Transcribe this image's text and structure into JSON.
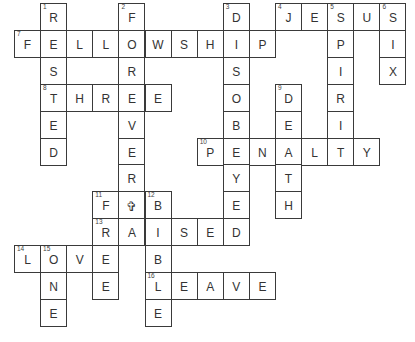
{
  "puzzle": {
    "type": "crossword",
    "cell_width": 26.1,
    "cell_height": 26.9,
    "origin_x": 14,
    "origin_y": 3,
    "cells": [
      {
        "r": 0,
        "c": 1,
        "letter": "R",
        "num": "1"
      },
      {
        "r": 0,
        "c": 4,
        "letter": "F",
        "num": "2"
      },
      {
        "r": 0,
        "c": 8,
        "letter": "D",
        "num": "3"
      },
      {
        "r": 0,
        "c": 10,
        "letter": "J",
        "num": "4"
      },
      {
        "r": 0,
        "c": 11,
        "letter": "E"
      },
      {
        "r": 0,
        "c": 12,
        "letter": "S",
        "num": "5"
      },
      {
        "r": 0,
        "c": 13,
        "letter": "U"
      },
      {
        "r": 0,
        "c": 14,
        "letter": "S",
        "num": "6"
      },
      {
        "r": 1,
        "c": 0,
        "letter": "F",
        "num": "7"
      },
      {
        "r": 1,
        "c": 1,
        "letter": "E"
      },
      {
        "r": 1,
        "c": 2,
        "letter": "L"
      },
      {
        "r": 1,
        "c": 3,
        "letter": "L"
      },
      {
        "r": 1,
        "c": 4,
        "letter": "O"
      },
      {
        "r": 1,
        "c": 5,
        "letter": "W"
      },
      {
        "r": 1,
        "c": 6,
        "letter": "S"
      },
      {
        "r": 1,
        "c": 7,
        "letter": "H"
      },
      {
        "r": 1,
        "c": 8,
        "letter": "I"
      },
      {
        "r": 1,
        "c": 9,
        "letter": "P"
      },
      {
        "r": 1,
        "c": 12,
        "letter": "P"
      },
      {
        "r": 1,
        "c": 14,
        "letter": "I"
      },
      {
        "r": 2,
        "c": 1,
        "letter": "S"
      },
      {
        "r": 2,
        "c": 4,
        "letter": "R"
      },
      {
        "r": 2,
        "c": 8,
        "letter": "S"
      },
      {
        "r": 2,
        "c": 12,
        "letter": "I"
      },
      {
        "r": 2,
        "c": 14,
        "letter": "X"
      },
      {
        "r": 3,
        "c": 1,
        "letter": "T",
        "num": "8"
      },
      {
        "r": 3,
        "c": 2,
        "letter": "H"
      },
      {
        "r": 3,
        "c": 3,
        "letter": "R"
      },
      {
        "r": 3,
        "c": 4,
        "letter": "E"
      },
      {
        "r": 3,
        "c": 5,
        "letter": "E"
      },
      {
        "r": 3,
        "c": 8,
        "letter": "O"
      },
      {
        "r": 3,
        "c": 10,
        "letter": "D",
        "num": "9"
      },
      {
        "r": 3,
        "c": 12,
        "letter": "R"
      },
      {
        "r": 4,
        "c": 1,
        "letter": "E"
      },
      {
        "r": 4,
        "c": 4,
        "letter": "V"
      },
      {
        "r": 4,
        "c": 8,
        "letter": "B"
      },
      {
        "r": 4,
        "c": 10,
        "letter": "E"
      },
      {
        "r": 4,
        "c": 12,
        "letter": "I"
      },
      {
        "r": 5,
        "c": 1,
        "letter": "D"
      },
      {
        "r": 5,
        "c": 4,
        "letter": "E"
      },
      {
        "r": 5,
        "c": 7,
        "letter": "P",
        "num": "10"
      },
      {
        "r": 5,
        "c": 8,
        "letter": "E"
      },
      {
        "r": 5,
        "c": 9,
        "letter": "N"
      },
      {
        "r": 5,
        "c": 10,
        "letter": "A"
      },
      {
        "r": 5,
        "c": 11,
        "letter": "L"
      },
      {
        "r": 5,
        "c": 12,
        "letter": "T"
      },
      {
        "r": 5,
        "c": 13,
        "letter": "Y"
      },
      {
        "r": 6,
        "c": 4,
        "letter": "R"
      },
      {
        "r": 6,
        "c": 8,
        "letter": "Y"
      },
      {
        "r": 6,
        "c": 10,
        "letter": "T"
      },
      {
        "r": 7,
        "c": 3,
        "letter": "F",
        "num": "11"
      },
      {
        "r": 7,
        "c": 4,
        "letter": "✞",
        "symbol": true
      },
      {
        "r": 7,
        "c": 5,
        "letter": "B",
        "num": "12"
      },
      {
        "r": 7,
        "c": 8,
        "letter": "E"
      },
      {
        "r": 7,
        "c": 10,
        "letter": "H"
      },
      {
        "r": 8,
        "c": 3,
        "letter": "R",
        "num": "13"
      },
      {
        "r": 8,
        "c": 4,
        "letter": "A"
      },
      {
        "r": 8,
        "c": 5,
        "letter": "I"
      },
      {
        "r": 8,
        "c": 6,
        "letter": "S"
      },
      {
        "r": 8,
        "c": 7,
        "letter": "E"
      },
      {
        "r": 8,
        "c": 8,
        "letter": "D"
      },
      {
        "r": 9,
        "c": 0,
        "letter": "L",
        "num": "14"
      },
      {
        "r": 9,
        "c": 1,
        "letter": "O",
        "num": "15"
      },
      {
        "r": 9,
        "c": 2,
        "letter": "V"
      },
      {
        "r": 9,
        "c": 3,
        "letter": "E"
      },
      {
        "r": 9,
        "c": 5,
        "letter": "B"
      },
      {
        "r": 10,
        "c": 1,
        "letter": "N"
      },
      {
        "r": 10,
        "c": 3,
        "letter": "E"
      },
      {
        "r": 10,
        "c": 5,
        "letter": "L",
        "num": "16"
      },
      {
        "r": 10,
        "c": 6,
        "letter": "E"
      },
      {
        "r": 10,
        "c": 7,
        "letter": "A"
      },
      {
        "r": 10,
        "c": 8,
        "letter": "V"
      },
      {
        "r": 10,
        "c": 9,
        "letter": "E"
      },
      {
        "r": 11,
        "c": 1,
        "letter": "E"
      },
      {
        "r": 11,
        "c": 5,
        "letter": "E"
      }
    ],
    "words": {
      "across": [
        {
          "num": "4",
          "answer": "JESUS"
        },
        {
          "num": "7",
          "answer": "FELLOWSHIP"
        },
        {
          "num": "8",
          "answer": "THREE"
        },
        {
          "num": "10",
          "answer": "PENALTY"
        },
        {
          "num": "11",
          "answer": "F✞B"
        },
        {
          "num": "13",
          "answer": "RAISED"
        },
        {
          "num": "14",
          "answer": "LOVE"
        },
        {
          "num": "16",
          "answer": "LEAVE"
        }
      ],
      "down": [
        {
          "num": "1",
          "answer": "RESTED"
        },
        {
          "num": "2",
          "answer": "FOREVER✞A"
        },
        {
          "num": "3",
          "answer": "DISOBEYED"
        },
        {
          "num": "5",
          "answer": "SPIRIT"
        },
        {
          "num": "6",
          "answer": "SIX"
        },
        {
          "num": "9",
          "answer": "DEATH"
        },
        {
          "num": "11",
          "answer": "FREE"
        },
        {
          "num": "12",
          "answer": "BIBLE"
        },
        {
          "num": "15",
          "answer": "ONE"
        }
      ]
    },
    "colors": {
      "background": "#ffffff",
      "border": "#3a3a3a",
      "letter": "#333333"
    }
  }
}
